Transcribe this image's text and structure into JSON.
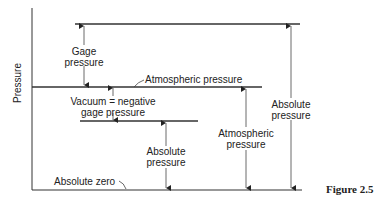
{
  "diagram": {
    "y_axis_label": "Pressure",
    "labels": {
      "gage_pressure_1": "Gage",
      "gage_pressure_2": "pressure",
      "atmospheric_line": "Atmospheric pressure",
      "vacuum_1": "Vacuum = negative",
      "vacuum_2": "gage pressure",
      "absolute_pressure_low_1": "Absolute",
      "absolute_pressure_low_2": "pressure",
      "atmospheric_pressure_1": "Atmospheric",
      "atmospheric_pressure_2": "pressure",
      "absolute_pressure_high_1": "Absolute",
      "absolute_pressure_high_2": "pressure",
      "absolute_zero": "Absolute zero"
    },
    "caption": "Figure 2.5"
  }
}
